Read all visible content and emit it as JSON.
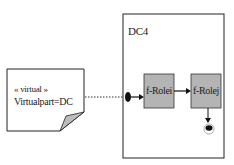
{
  "note": {
    "stereotype": "« virtual »",
    "text": "Virtualpart=DC"
  },
  "container": {
    "title": "DC4"
  },
  "nodes": [
    {
      "label": "f-Rolei"
    },
    {
      "label": "f-Rolej"
    }
  ],
  "colors": {
    "node_fill": "#b4b4b4",
    "stroke": "#222222"
  }
}
